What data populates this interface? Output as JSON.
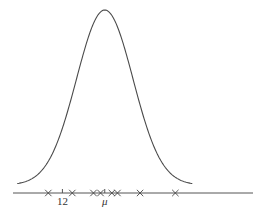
{
  "diagram": {
    "type": "normal-distribution-with-samples",
    "mean_symbol": "μ",
    "tick_labels": [
      {
        "id": "twelve",
        "text": "12",
        "value": 12
      },
      {
        "id": "mu",
        "text": "μ",
        "value": 15
      }
    ],
    "axis_range": [
      8.5,
      25.5
    ],
    "curve": {
      "mean": 15,
      "sd": 2.0
    },
    "samples": [
      11.0,
      12.7,
      14.2,
      14.7,
      15.5,
      15.9,
      17.5,
      20.0
    ],
    "colors": {
      "curve": "#4a4a4a",
      "axis": "#555555",
      "marker": "#444444"
    }
  }
}
